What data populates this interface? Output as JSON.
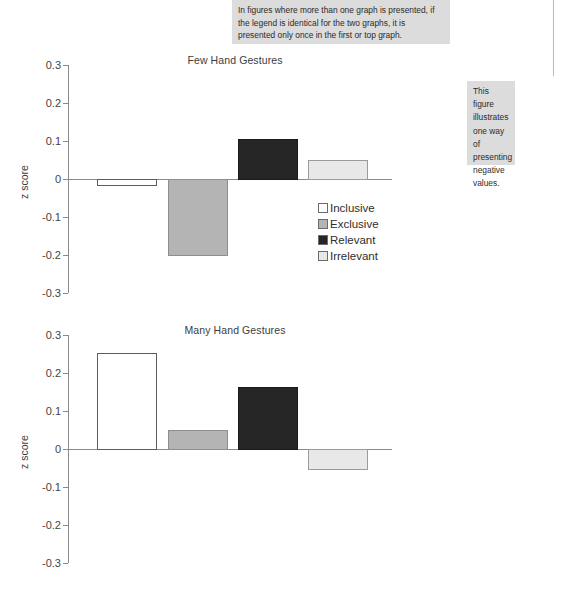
{
  "annotations": {
    "top": "In figures where more than one graph is presented, if the legend is identical for the two graphs, it is presented only once in the first or top graph.",
    "right": "This figure illustrates one way of presenting negative values."
  },
  "legend": {
    "items": [
      {
        "label": "Inclusive",
        "color": "#ffffff"
      },
      {
        "label": "Exclusive",
        "color": "#b4b4b4"
      },
      {
        "label": "Relevant",
        "color": "#262626"
      },
      {
        "label": "Irrelevant",
        "color": "#e8e8e8"
      }
    ]
  },
  "chart_data": [
    {
      "type": "bar",
      "title": "Few Hand Gestures",
      "xlabel": "",
      "ylabel": "z score",
      "ylim": [
        -0.3,
        0.3
      ],
      "yticks": [
        "0.3",
        "0.2",
        "0.1",
        "0",
        "-0.1",
        "-0.2",
        "-0.3"
      ],
      "ytick_values": [
        0.3,
        0.2,
        0.1,
        0,
        -0.1,
        -0.2,
        -0.3
      ],
      "grid": false,
      "legend_position": "inside-lower-right",
      "categories": [
        "Inclusive",
        "Exclusive",
        "Relevant",
        "Irrelevant"
      ],
      "values": [
        -0.015,
        -0.2,
        0.105,
        0.05
      ],
      "colors": [
        "#ffffff",
        "#b4b4b4",
        "#262626",
        "#e8e8e8"
      ]
    },
    {
      "type": "bar",
      "title": "Many Hand Gestures",
      "xlabel": "",
      "ylabel": "z score",
      "ylim": [
        -0.3,
        0.3
      ],
      "yticks": [
        "0.3",
        "0.2",
        "0.1",
        "0",
        "-0.1",
        "-0.2",
        "-0.3"
      ],
      "ytick_values": [
        0.3,
        0.2,
        0.1,
        0,
        -0.1,
        -0.2,
        -0.3
      ],
      "grid": false,
      "legend_position": "none",
      "categories": [
        "Inclusive",
        "Exclusive",
        "Relevant",
        "Irrelevant"
      ],
      "values": [
        0.252,
        0.05,
        0.162,
        -0.052
      ],
      "colors": [
        "#ffffff",
        "#b4b4b4",
        "#262626",
        "#e8e8e8"
      ]
    }
  ]
}
